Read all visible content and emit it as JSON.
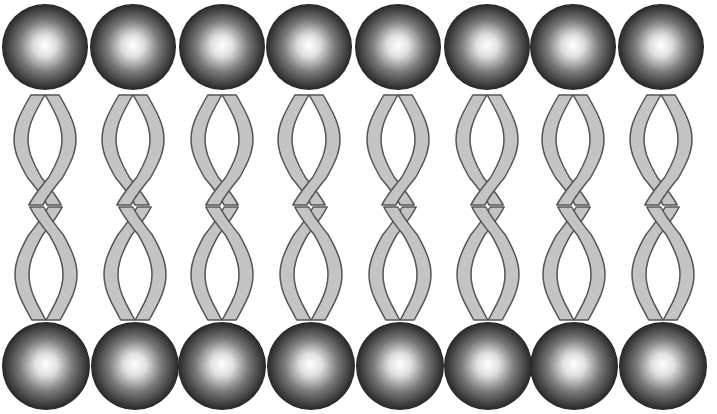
{
  "diagram": {
    "type": "phospholipid-bilayer",
    "colors": {
      "background": "#ffffff",
      "head_center": "#ffffff",
      "head_mid": "#8a8a8a",
      "head_edge": "#2a2a2a",
      "tail_fill": "#c4c4c4",
      "tail_stroke": "#555555"
    },
    "top_layer": {
      "head_y": 47,
      "head_radius": 43,
      "tail_top": 95,
      "tail_bottom": 205,
      "head_x": [
        45,
        133,
        222,
        309,
        398,
        487,
        573,
        661
      ]
    },
    "bottom_layer": {
      "head_y": 366,
      "head_radius": 44,
      "tail_top": 207,
      "tail_bottom": 320,
      "head_x": [
        46,
        135,
        222,
        311,
        400,
        488,
        574,
        663
      ]
    },
    "molecule_count_per_layer": 8
  }
}
